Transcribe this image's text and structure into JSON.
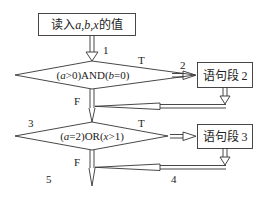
{
  "diagram": {
    "type": "flowchart",
    "nodes": {
      "input": {
        "prefix": "读入",
        "vars": "a,b,x",
        "suffix": "的值"
      },
      "cond1": {
        "parts": [
          "(",
          "a",
          ">0)AND(",
          "b",
          "=0)"
        ]
      },
      "stmt2": {
        "label": "语句段 2"
      },
      "cond2": {
        "parts": [
          "(",
          "a",
          "=2)OR(",
          "x",
          ">1)"
        ]
      },
      "stmt3": {
        "label": "语句段 3"
      }
    },
    "branch_labels": {
      "cond1_true": "T",
      "cond1_false": "F",
      "cond2_true": "T",
      "cond2_false": "F"
    },
    "path_labels": {
      "p1": "1",
      "p2": "2",
      "p3": "3",
      "p4": "4",
      "p5": "5"
    },
    "colors": {
      "stroke": "#333333",
      "text": "#222222",
      "background": "#ffffff"
    }
  }
}
